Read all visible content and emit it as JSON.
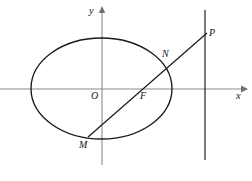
{
  "figure": {
    "width": 252,
    "height": 181,
    "background_color": "#ffffff",
    "curve_color": "#1a1a1a",
    "axis_color": "#8a8a8a"
  },
  "axes": {
    "x_axis": {
      "label": "x",
      "y_pixel": 89,
      "x_start": 0,
      "x_end": 243,
      "has_arrow": true
    },
    "y_axis": {
      "label": "y",
      "x_pixel": 102,
      "y_start": 10,
      "y_end": 165,
      "has_arrow": true
    }
  },
  "ellipse": {
    "center": {
      "x": 101.5,
      "y": 88.5
    },
    "rx": 70.5,
    "ry": 50.5
  },
  "directrix": {
    "x_pixel": 205,
    "y_top": 10,
    "y_bottom": 160
  },
  "secant": {
    "from": {
      "x": 88,
      "y": 137
    },
    "to": {
      "x": 207,
      "y": 33
    }
  },
  "points": [
    {
      "name": "origin",
      "label": "O",
      "x": 102,
      "y": 89
    },
    {
      "name": "focus",
      "label": "F",
      "x": 141,
      "y": 89
    },
    {
      "name": "intersect-n",
      "label": "N",
      "x": 163,
      "y": 60
    },
    {
      "name": "intersect-m",
      "label": "M",
      "x": 88,
      "y": 137
    },
    {
      "name": "point-p",
      "label": "P",
      "x": 207,
      "y": 33
    }
  ],
  "labels": {
    "y_axis": "y",
    "x_axis": "x",
    "origin": "O",
    "focus": "F",
    "n": "N",
    "m": "M",
    "p": "P"
  }
}
